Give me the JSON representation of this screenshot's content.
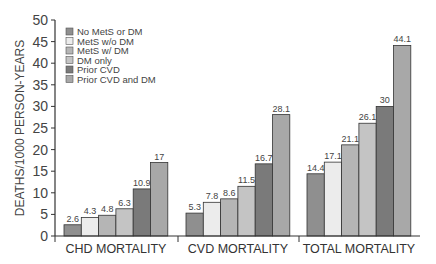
{
  "chart_data": {
    "type": "bar",
    "title": "",
    "xlabel": "",
    "ylabel": "DEATHS/1000 PERSON-YEARS",
    "ylim": [
      0,
      50
    ],
    "yticks": [
      0,
      5,
      10,
      15,
      20,
      25,
      30,
      35,
      40,
      45,
      50
    ],
    "grid": false,
    "legend_position": "upper-left",
    "categories": [
      "CHD MORTALITY",
      "CVD MORTALITY",
      "TOTAL MORTALITY"
    ],
    "series": [
      {
        "name": "No MetS or DM",
        "color": "#8f8f8f",
        "values": [
          2.6,
          5.3,
          14.4
        ]
      },
      {
        "name": "MetS w/o DM",
        "color": "#ececec",
        "values": [
          4.3,
          7.8,
          17.1
        ]
      },
      {
        "name": "MetS w/ DM",
        "color": "#b5b5b5",
        "values": [
          4.8,
          8.6,
          21.1
        ]
      },
      {
        "name": "DM only",
        "color": "#c4c4c4",
        "values": [
          6.3,
          11.5,
          26.1
        ]
      },
      {
        "name": "Prior CVD",
        "color": "#7a7a7a",
        "values": [
          10.9,
          16.7,
          30
        ]
      },
      {
        "name": "Prior CVD and DM",
        "color": "#a8a8a8",
        "values": [
          17,
          28.1,
          44.1
        ]
      }
    ],
    "value_labels": [
      [
        "2.6",
        "4.3",
        "4.8",
        "6.3",
        "10.9",
        "17"
      ],
      [
        "5.3",
        "7.8",
        "8.6",
        "11.5",
        "16.7",
        "28.1"
      ],
      [
        "14.4",
        "17.1",
        "21.1",
        "26.1",
        "30",
        "44.1"
      ]
    ]
  }
}
